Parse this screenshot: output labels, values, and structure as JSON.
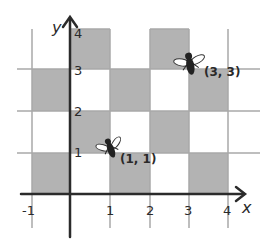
{
  "diagram": {
    "type": "coordinate-grid",
    "colors": {
      "shade": "#b3b3b3",
      "grid": "#a8a8a8",
      "axis": "#2b2b2b",
      "background": "#ffffff"
    },
    "axes": {
      "x_label": "x",
      "y_label": "y",
      "x_ticks": [
        "-1",
        "1",
        "2",
        "3",
        "4"
      ],
      "y_ticks": [
        "1",
        "2",
        "3",
        "4"
      ]
    },
    "shaded_cells": [
      {
        "x0": 0,
        "y0": 3
      },
      {
        "x0": 2,
        "y0": 3
      },
      {
        "x0": -1,
        "y0": 2
      },
      {
        "x0": 1,
        "y0": 2
      },
      {
        "x0": 3,
        "y0": 2
      },
      {
        "x0": 0,
        "y0": 1
      },
      {
        "x0": 2,
        "y0": 1
      },
      {
        "x0": -1,
        "y0": 0
      },
      {
        "x0": 1,
        "y0": 0
      },
      {
        "x0": 3,
        "y0": 0
      }
    ],
    "points": [
      {
        "label": "(1, 1)",
        "x": 1,
        "y": 1,
        "icon": "fly-icon"
      },
      {
        "label": "(3, 3)",
        "x": 3,
        "y": 3,
        "icon": "fly-icon"
      }
    ]
  }
}
